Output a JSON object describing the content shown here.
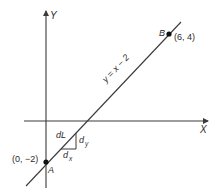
{
  "diagram": {
    "axes": {
      "x_label": "X",
      "y_label": "Y"
    },
    "line": {
      "equation": "y = x − 2"
    },
    "points": {
      "A": {
        "name": "A",
        "coords": "(0, −2)"
      },
      "B": {
        "name": "B",
        "coords": "(6, 4)"
      }
    },
    "triangle": {
      "hypotenuse": "dL",
      "vertical": "d",
      "vertical_sub": "y",
      "horizontal": "d",
      "horizontal_sub": "x"
    },
    "colors": {
      "stroke": "#3a3a3a",
      "text": "#2b2b2b",
      "background": "#ffffff"
    }
  }
}
